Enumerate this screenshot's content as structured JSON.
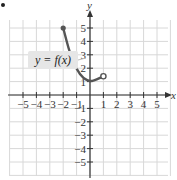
{
  "chart_data": {
    "type": "line",
    "title": "",
    "xlabel": "x",
    "ylabel": "y",
    "xlim": [
      -5.5,
      5.5
    ],
    "ylim": [
      -6,
      6
    ],
    "grid": true,
    "x_ticks": [
      -5,
      -4,
      -3,
      -2,
      -1,
      1,
      2,
      3,
      4,
      5
    ],
    "y_ticks": [
      -5,
      -4,
      -3,
      -2,
      -1,
      1,
      2,
      3,
      4,
      5
    ],
    "x_tick_labels": [
      "−5",
      "−4",
      "−3",
      "−2",
      "−1",
      "1",
      "2",
      "3",
      "4",
      "5"
    ],
    "y_tick_labels": [
      "−5",
      "−4",
      "−3",
      "−2",
      "−1",
      "1",
      "2",
      "3",
      "4",
      "5"
    ],
    "series": [
      {
        "name": "y = f(x)",
        "color": "#555555",
        "points": [
          [
            -2,
            5
          ],
          [
            -1.5,
            3.1
          ],
          [
            -1,
            1.9
          ],
          [
            -0.5,
            1.25
          ],
          [
            0,
            1
          ],
          [
            0.5,
            1.15
          ],
          [
            1,
            1.4
          ]
        ],
        "start": {
          "x": -2,
          "y": 5,
          "marker": "closed"
        },
        "end": {
          "x": 1,
          "y": 1.4,
          "marker": "open"
        }
      }
    ],
    "annotations": [
      {
        "text": "y = f(x)",
        "x": -3.2,
        "y": 2.8
      }
    ]
  },
  "labels": {
    "x_axis": "x",
    "y_axis": "y",
    "function": "y = f(x)",
    "item_bullet": "•"
  },
  "colors": {
    "grid": "#d8d8d8",
    "axis": "#333333",
    "curve": "#555555",
    "label_box": "#e6e6e6"
  }
}
